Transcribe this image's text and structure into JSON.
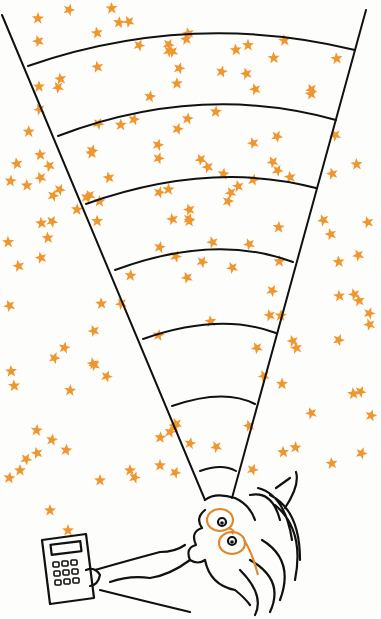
{
  "illustration": {
    "caption": "Hand-drawn cartoon: a bespectacled man lying on his back holding a calculator, gazing up through a widening cone of vision divided into curved bands, filled with orange stars",
    "colors": {
      "background": "#fdfdfb",
      "ink": "#111111",
      "star": "#f0962e",
      "glasses": "#e0882a"
    },
    "cone": {
      "apex": [
        205,
        500
      ],
      "left_edge_top": [
        2,
        15
      ],
      "right_edge_top": [
        366,
        10
      ],
      "band_count": 7
    },
    "star_count_approx": 150
  }
}
